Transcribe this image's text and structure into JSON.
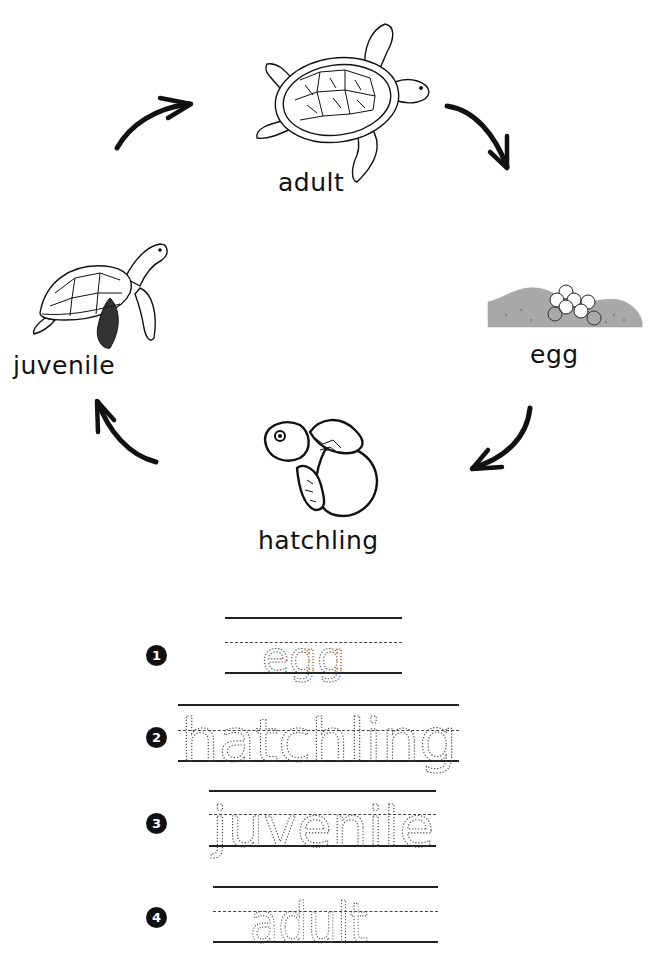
{
  "diagram": {
    "stages": [
      {
        "id": "adult",
        "label": "adult"
      },
      {
        "id": "egg",
        "label": "egg"
      },
      {
        "id": "hatchling",
        "label": "hatchling"
      },
      {
        "id": "juvenile",
        "label": "juvenile"
      }
    ],
    "arrows": [
      {
        "from": "juvenile",
        "to": "adult"
      },
      {
        "from": "adult",
        "to": "egg"
      },
      {
        "from": "egg",
        "to": "hatchling"
      },
      {
        "from": "hatchling",
        "to": "juvenile"
      }
    ]
  },
  "tracing": {
    "rows": [
      {
        "number": "1",
        "word": "egg"
      },
      {
        "number": "2",
        "word": "hatchling"
      },
      {
        "number": "3",
        "word": "juvenile"
      },
      {
        "number": "4",
        "word": "adult"
      }
    ]
  },
  "colors": {
    "ink": "#111111",
    "sand": "#a9a9a9",
    "guide_line": "#222222"
  }
}
